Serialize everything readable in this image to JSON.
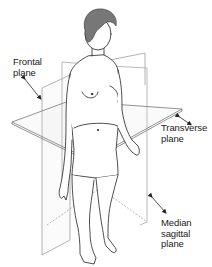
{
  "diagram": {
    "labels": {
      "frontal": "Frontal\nplane",
      "transverse": "Transverse\nplane",
      "median_sagittal": "Median\nsagittal\nplane"
    },
    "colors": {
      "background": "#ffffff",
      "line": "#222222",
      "plane_edge": "#9a9a9a",
      "hair": "#777777",
      "text": "#222222"
    }
  }
}
